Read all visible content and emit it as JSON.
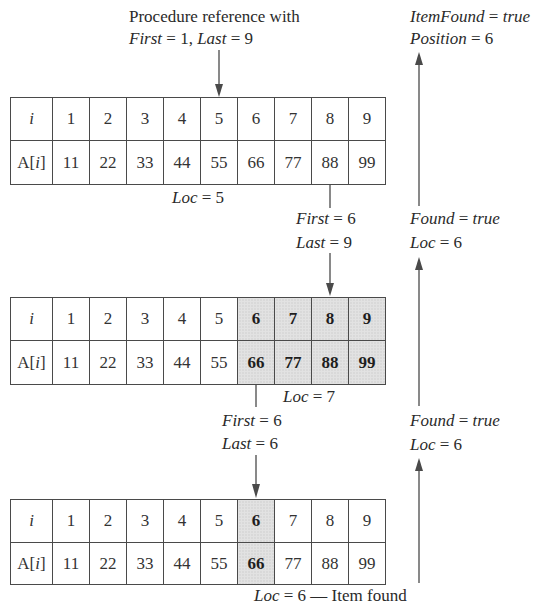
{
  "diagram": {
    "type": "binary-search-trace",
    "colors": {
      "line": "#4a4a4a",
      "shade": "#e2e2e2",
      "text": "#2a2a2a"
    },
    "top_label": {
      "line1": "Procedure reference with",
      "line2_parts": [
        {
          "text": "First",
          "italic": true
        },
        {
          "text": " = 1, ",
          "italic": false
        },
        {
          "text": "Last",
          "italic": true
        },
        {
          "text": " = 9",
          "italic": false
        }
      ]
    },
    "result_label": {
      "line1_var": "ItemFound",
      "line1_eq": " = ",
      "line1_val": "true",
      "line2_var": "Position",
      "line2_eq": " = 6"
    },
    "row_header_index": "i",
    "row_header_value_prefix": "A[",
    "row_header_value_var": "i",
    "row_header_value_suffix": "]",
    "indices": [
      "1",
      "2",
      "3",
      "4",
      "5",
      "6",
      "7",
      "8",
      "9"
    ],
    "values": [
      "11",
      "22",
      "33",
      "44",
      "55",
      "66",
      "77",
      "88",
      "99"
    ],
    "steps": [
      {
        "table_shaded_columns": [],
        "loc_label": {
          "var": "Loc",
          "rest": " = 5"
        },
        "next_bounds": {
          "first_var": "First",
          "first_rest": " = 6",
          "last_var": "Last",
          "last_rest": " = 9"
        },
        "return_label": {
          "var1": "Found",
          "eq1": " = ",
          "val1": "true",
          "var2": "Loc",
          "rest2": " = 6"
        }
      },
      {
        "table_shaded_columns": [
          6,
          7,
          8,
          9
        ],
        "loc_label": {
          "var": "Loc",
          "rest": " = 7"
        },
        "next_bounds": {
          "first_var": "First",
          "first_rest": " = 6",
          "last_var": "Last",
          "last_rest": " = 6"
        },
        "return_label": {
          "var1": "Found",
          "eq1": " = ",
          "val1": "true",
          "var2": "Loc",
          "rest2": " = 6"
        }
      },
      {
        "table_shaded_columns": [
          6
        ],
        "loc_label": {
          "var": "Loc",
          "rest": " = 6 — Item found"
        }
      }
    ]
  }
}
